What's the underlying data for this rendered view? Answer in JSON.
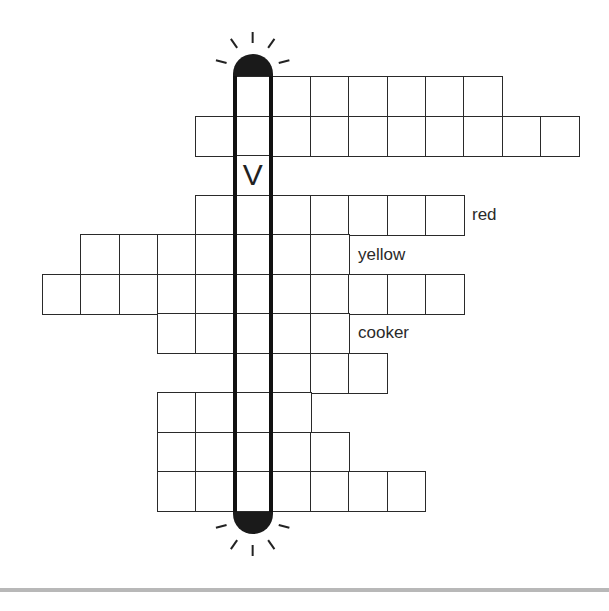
{
  "puzzle": {
    "grid": {
      "origin_x": 42,
      "origin_y": 76,
      "cell_w": 38.3,
      "cell_h": 39.5,
      "highlight_col": 5,
      "rows": [
        {
          "start": 5,
          "count": 7,
          "label": ""
        },
        {
          "start": 4,
          "count": 10,
          "label": ""
        },
        {
          "start": 5,
          "count": 1,
          "label": "",
          "letter": "V"
        },
        {
          "start": 4,
          "count": 7,
          "label": "red"
        },
        {
          "start": 1,
          "count": 7,
          "label": "yellow"
        },
        {
          "start": 0,
          "count": 11,
          "label": ""
        },
        {
          "start": 3,
          "count": 5,
          "label": "cooker"
        },
        {
          "start": 5,
          "count": 4,
          "label": ""
        },
        {
          "start": 3,
          "count": 4,
          "label": ""
        },
        {
          "start": 3,
          "count": 5,
          "label": ""
        },
        {
          "start": 3,
          "count": 7,
          "label": ""
        }
      ]
    },
    "clues": {
      "red": "red",
      "yellow": "yellow",
      "cooker": "cooker"
    },
    "hidden_word_letter": "V",
    "colors": {
      "line": "#2a2a2a",
      "highlight": "#111111",
      "rule": "#b8b8b8"
    }
  }
}
